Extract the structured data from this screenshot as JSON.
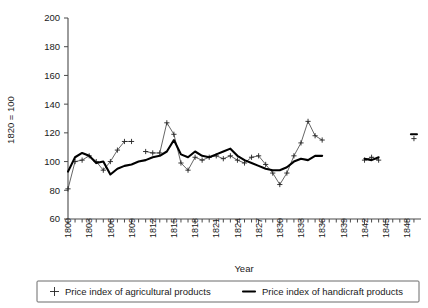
{
  "chart_data": {
    "type": "line",
    "title": "",
    "xlabel": "Year",
    "ylabel": "1820 = 100",
    "xlim": [
      1800,
      1849
    ],
    "ylim": [
      60,
      200
    ],
    "ytick_step": 20,
    "xtick_step": 3,
    "grid": false,
    "legend_position": "bottom",
    "ytick_labels": [
      "60",
      "80",
      "100",
      "120",
      "140",
      "160",
      "180",
      "200"
    ],
    "ytick_values": [
      60,
      80,
      100,
      120,
      140,
      160,
      180,
      200
    ],
    "xtick_labels": [
      "1800",
      "1803",
      "1806",
      "1809",
      "1812",
      "1815",
      "1818",
      "1821",
      "1824",
      "1827",
      "1830",
      "1833",
      "1836",
      "1839",
      "1842",
      "1845",
      "1848"
    ],
    "xtick_values": [
      1800,
      1803,
      1806,
      1809,
      1812,
      1815,
      1818,
      1821,
      1824,
      1827,
      1830,
      1833,
      1836,
      1839,
      1842,
      1845,
      1848
    ],
    "series": [
      {
        "name": "Price index of agricultural products",
        "marker": "plus",
        "style": "thin-with-markers",
        "x": [
          1800,
          1801,
          1802,
          1803,
          1804,
          1805,
          1806,
          1807,
          1808,
          1809,
          1811,
          1812,
          1813,
          1814,
          1815,
          1816,
          1817,
          1818,
          1819,
          1820,
          1821,
          1822,
          1823,
          1824,
          1825,
          1826,
          1827,
          1828,
          1829,
          1830,
          1831,
          1832,
          1833,
          1834,
          1835,
          1836,
          1842,
          1843,
          1844,
          1849
        ],
        "values": [
          81,
          100,
          101,
          104,
          100,
          94,
          100,
          108,
          114,
          114,
          107,
          106,
          106,
          127,
          119,
          99,
          94,
          103,
          101,
          103,
          104,
          102,
          104,
          101,
          99,
          103,
          104,
          98,
          92,
          84,
          92,
          104,
          113,
          128,
          118,
          115,
          101,
          103,
          101,
          116
        ],
        "segments": [
          {
            "x": [
              1800,
              1801,
              1802,
              1803,
              1804,
              1805,
              1806,
              1807,
              1808,
              1809
            ],
            "values": [
              81,
              100,
              101,
              104,
              100,
              94,
              100,
              108,
              114,
              114
            ]
          },
          {
            "x": [
              1811,
              1812,
              1813,
              1814,
              1815,
              1816,
              1817,
              1818,
              1819,
              1820,
              1821,
              1822,
              1823,
              1824,
              1825,
              1826,
              1827,
              1828,
              1829,
              1830,
              1831,
              1832,
              1833,
              1834,
              1835,
              1836
            ],
            "values": [
              107,
              106,
              106,
              127,
              119,
              99,
              94,
              103,
              101,
              103,
              104,
              102,
              104,
              101,
              99,
              103,
              104,
              98,
              92,
              84,
              92,
              104,
              113,
              128,
              118,
              115
            ]
          },
          {
            "x": [
              1842,
              1843,
              1844
            ],
            "values": [
              101,
              103,
              101
            ]
          },
          {
            "x": [
              1849
            ],
            "values": [
              116
            ]
          }
        ]
      },
      {
        "name": "Price index of handicraft products",
        "marker": "none",
        "style": "thick-line",
        "x": [
          1800,
          1801,
          1802,
          1803,
          1804,
          1805,
          1806,
          1807,
          1808,
          1809,
          1810,
          1811,
          1812,
          1813,
          1814,
          1815,
          1816,
          1817,
          1818,
          1819,
          1820,
          1821,
          1822,
          1823,
          1824,
          1825,
          1826,
          1827,
          1828,
          1829,
          1830,
          1831,
          1832,
          1833,
          1834,
          1835,
          1836,
          1842,
          1843,
          1844,
          1849
        ],
        "values": [
          93,
          103,
          106,
          104,
          99,
          100,
          91,
          95,
          97,
          98,
          100,
          101,
          103,
          104,
          107,
          115,
          105,
          103,
          107,
          104,
          103,
          105,
          107,
          109,
          104,
          101,
          99,
          97,
          95,
          94,
          94,
          96,
          100,
          102,
          101,
          104,
          104,
          102,
          101,
          103,
          119
        ],
        "segments": [
          {
            "x": [
              1800,
              1801,
              1802,
              1803,
              1804,
              1805,
              1806,
              1807,
              1808,
              1809,
              1810,
              1811,
              1812,
              1813,
              1814,
              1815,
              1816,
              1817,
              1818,
              1819,
              1820,
              1821,
              1822,
              1823,
              1824,
              1825,
              1826,
              1827,
              1828,
              1829,
              1830,
              1831,
              1832,
              1833,
              1834,
              1835,
              1836
            ],
            "values": [
              93,
              103,
              106,
              104,
              99,
              100,
              91,
              95,
              97,
              98,
              100,
              101,
              103,
              104,
              107,
              115,
              105,
              103,
              107,
              104,
              103,
              105,
              107,
              109,
              104,
              101,
              99,
              97,
              95,
              94,
              94,
              96,
              100,
              102,
              101,
              104,
              104
            ]
          },
          {
            "x": [
              1842,
              1843,
              1844
            ],
            "values": [
              102,
              101,
              103
            ]
          },
          {
            "x": [
              1849
            ],
            "values": [
              119
            ]
          }
        ]
      }
    ]
  },
  "legend": {
    "items": [
      {
        "label": "Price index of agricultural products",
        "marker": "plus"
      },
      {
        "label": "Price index of handicraft products",
        "marker": "line"
      }
    ]
  },
  "colors": {
    "axis": "#4a4a4a",
    "agricultural": "#555555",
    "handicraft": "#000000",
    "background": "#ffffff",
    "text": "#1a1a1a"
  }
}
